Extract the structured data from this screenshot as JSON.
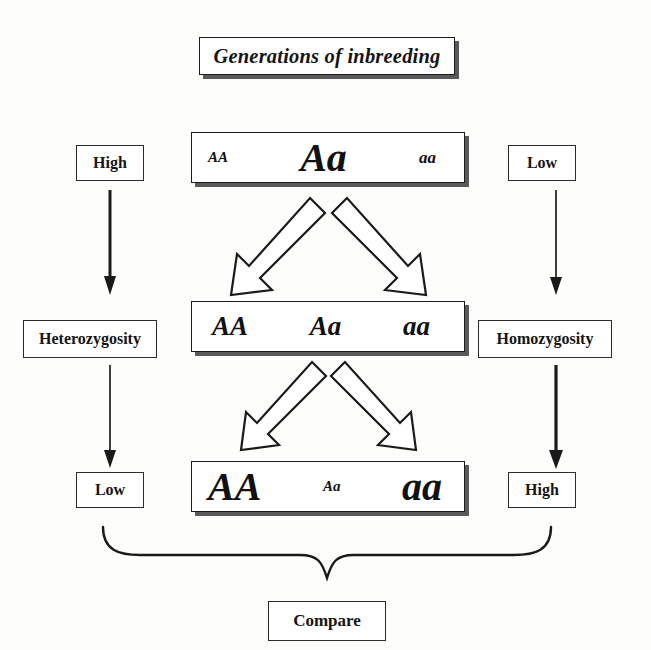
{
  "title": {
    "text": "Generations of inbreeding"
  },
  "generations": [
    {
      "row": 1,
      "alleles": [
        {
          "text": "AA",
          "size": "tiny"
        },
        {
          "text": "Aa",
          "size": "large"
        },
        {
          "text": "aa",
          "size": "small"
        }
      ]
    },
    {
      "row": 2,
      "alleles": [
        {
          "text": "AA",
          "size": "med"
        },
        {
          "text": "Aa",
          "size": "med"
        },
        {
          "text": "aa",
          "size": "med"
        }
      ]
    },
    {
      "row": 3,
      "alleles": [
        {
          "text": "AA",
          "size": "large"
        },
        {
          "text": "Aa",
          "size": "tiny"
        },
        {
          "text": "aa",
          "size": "large"
        }
      ]
    }
  ],
  "left_axis": {
    "top_level": "High",
    "measure": "Heterozygosity",
    "bottom_level": "Low"
  },
  "right_axis": {
    "top_level": "Low",
    "measure": "Homozygosity",
    "bottom_level": "High"
  },
  "conclusion": {
    "label": "Compare"
  },
  "colors": {
    "ink": "#151515",
    "box_border": "#2b2b2b",
    "shadow": "#5a5a5a",
    "paper": "#fdfdfb",
    "arrow_fill": "#ffffff",
    "arrow_stroke": "#1a1a1a"
  }
}
